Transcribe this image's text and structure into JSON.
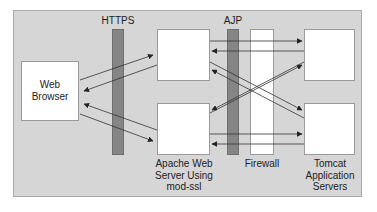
{
  "diagram": {
    "protocols": {
      "https": "HTTPS",
      "ajp": "AJP"
    },
    "nodes": {
      "browser": "Web\nBrowser",
      "apache_label": "Apache Web\nServer Using\nmod-ssl",
      "firewall_label": "Firewall",
      "tomcat_label": "Tomcat\nApplication\nServers"
    },
    "colors": {
      "background": "#d6d6d6",
      "box": "#ffffff",
      "protocol_bar": "#858585",
      "firewall": "#ffffff",
      "arrow": "#333333"
    },
    "connections": [
      {
        "from": "Web Browser",
        "to": "Apache (top)"
      },
      {
        "from": "Apache (top)",
        "to": "Web Browser"
      },
      {
        "from": "Apache (bottom)",
        "to": "Web Browser"
      },
      {
        "from": "Web Browser",
        "to": "Apache (bottom)"
      },
      {
        "from": "Apache (top)",
        "to": "Tomcat (top)"
      },
      {
        "from": "Tomcat (top)",
        "to": "Apache (top)"
      },
      {
        "from": "Apache (top)",
        "to": "Tomcat (bottom)"
      },
      {
        "from": "Tomcat (bottom)",
        "to": "Apache (top)"
      },
      {
        "from": "Apache (bottom)",
        "to": "Tomcat (top)"
      },
      {
        "from": "Tomcat (top)",
        "to": "Apache (bottom)"
      },
      {
        "from": "Apache (bottom)",
        "to": "Tomcat (bottom)"
      },
      {
        "from": "Tomcat (bottom)",
        "to": "Apache (bottom)"
      }
    ]
  }
}
